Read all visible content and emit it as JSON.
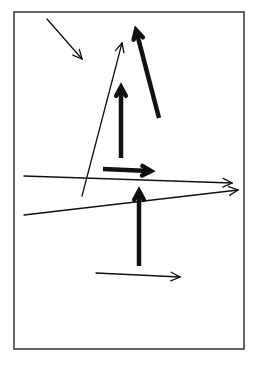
{
  "diagram": {
    "type": "arrow-field",
    "background": "#ffffff",
    "stroke_color": "#111111",
    "frame": {
      "x": 14,
      "y": 12,
      "width": 230,
      "height": 337,
      "stroke": "#333333",
      "stroke_width": 1.5
    },
    "arrows": [
      {
        "id": "diag-down-right",
        "x1": 47,
        "y1": 19,
        "x2": 82,
        "y2": 59,
        "weight": "thin"
      },
      {
        "id": "thin-up-right",
        "x1": 82,
        "y1": 196,
        "x2": 122,
        "y2": 43,
        "weight": "thin"
      },
      {
        "id": "thick-up-left",
        "x1": 159,
        "y1": 118,
        "x2": 136,
        "y2": 30,
        "weight": "thick"
      },
      {
        "id": "thick-up-upper",
        "x1": 121,
        "y1": 158,
        "x2": 121,
        "y2": 87,
        "weight": "thick"
      },
      {
        "id": "thick-right-short",
        "x1": 103,
        "y1": 169,
        "x2": 151,
        "y2": 171,
        "weight": "thick"
      },
      {
        "id": "long-right-1",
        "x1": 24,
        "y1": 176,
        "x2": 232,
        "y2": 183,
        "weight": "thin"
      },
      {
        "id": "long-right-2",
        "x1": 24,
        "y1": 215,
        "x2": 238,
        "y2": 190,
        "weight": "thin"
      },
      {
        "id": "thick-up-lower",
        "x1": 139,
        "y1": 266,
        "x2": 139,
        "y2": 191,
        "weight": "thick"
      },
      {
        "id": "thin-right-bottom",
        "x1": 96,
        "y1": 273,
        "x2": 180,
        "y2": 277,
        "weight": "thin"
      }
    ]
  }
}
